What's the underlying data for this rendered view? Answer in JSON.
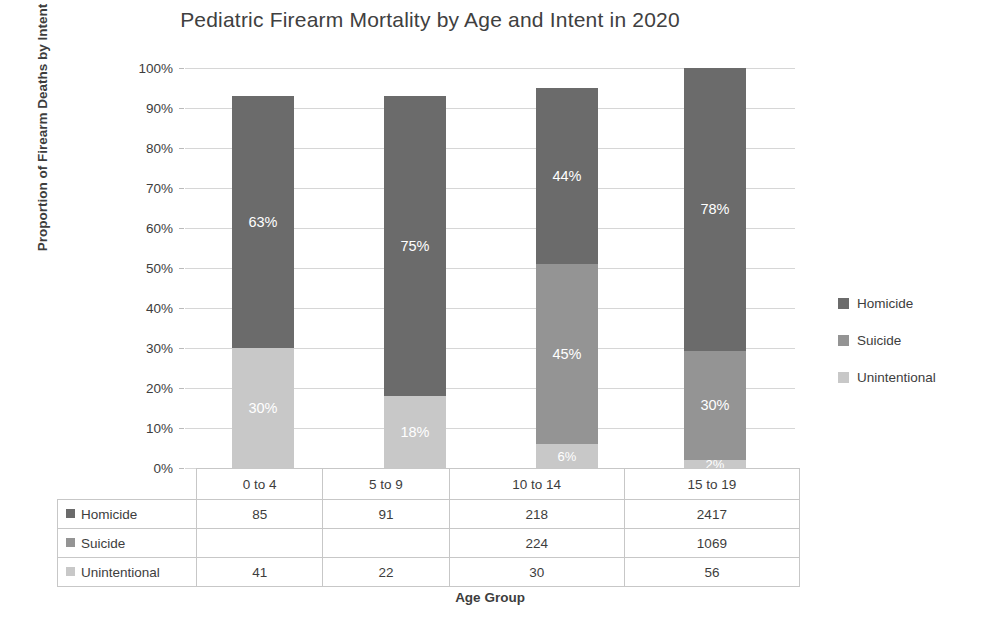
{
  "chart_data": {
    "type": "bar",
    "subtype": "stacked-100-percent",
    "title": "Pediatric Firearm Mortality by Age and Intent in 2020",
    "xlabel": "Age Group",
    "ylabel": "Proportion of Firearm Deaths by Intent",
    "categories": [
      "0 to 4",
      "5 to 9",
      "10 to 14",
      "15 to 19"
    ],
    "ylim": [
      0,
      100
    ],
    "ytick_labels": [
      "0%",
      "10%",
      "20%",
      "30%",
      "40%",
      "50%",
      "60%",
      "70%",
      "80%",
      "90%",
      "100%"
    ],
    "ytick_values": [
      0,
      10,
      20,
      30,
      40,
      50,
      60,
      70,
      80,
      90,
      100
    ],
    "grid": true,
    "legend_position": "right",
    "series": [
      {
        "name": "Homicide",
        "color": "#6b6b6b",
        "percent_labels": [
          "63%",
          "75%",
          "44%",
          "78%"
        ],
        "percent_values": [
          63,
          75,
          44,
          78
        ],
        "counts": [
          "85",
          "91",
          "218",
          "2417"
        ]
      },
      {
        "name": "Suicide",
        "color": "#949494",
        "percent_labels": [
          "",
          "",
          "45%",
          "30%"
        ],
        "percent_values": [
          0,
          0,
          45,
          30
        ],
        "counts": [
          "",
          "",
          "224",
          "1069"
        ]
      },
      {
        "name": "Unintentional",
        "color": "#c8c8c8",
        "percent_labels": [
          "30%",
          "18%",
          "6%",
          "2%"
        ],
        "percent_values": [
          30,
          18,
          6,
          2
        ],
        "counts": [
          "41",
          "22",
          "30",
          "56"
        ]
      }
    ]
  },
  "table": {
    "corner": "",
    "column_headers": [
      "0 to 4",
      "5 to 9",
      "10 to 14",
      "15 to 19"
    ],
    "rows": [
      {
        "label": "Homicide",
        "color": "#6b6b6b",
        "values": [
          "85",
          "91",
          "218",
          "2417"
        ]
      },
      {
        "label": "Suicide",
        "color": "#949494",
        "values": [
          "",
          "",
          "224",
          "1069"
        ]
      },
      {
        "label": "Unintentional",
        "color": "#c8c8c8",
        "values": [
          "41",
          "22",
          "30",
          "56"
        ]
      }
    ]
  },
  "legend": {
    "items": [
      {
        "label": "Homicide",
        "color": "#6b6b6b"
      },
      {
        "label": "Suicide",
        "color": "#949494"
      },
      {
        "label": "Unintentional",
        "color": "#c8c8c8"
      }
    ]
  }
}
